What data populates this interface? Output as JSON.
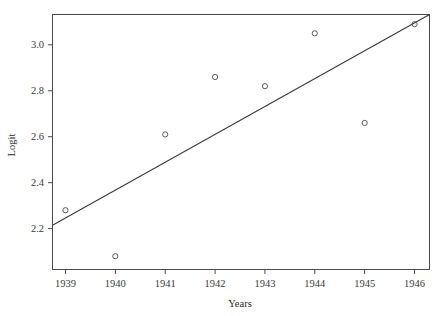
{
  "chart_data": {
    "type": "scatter",
    "title": "",
    "xlabel": "Years",
    "ylabel": "Logit",
    "x": [
      1939,
      1940,
      1941,
      1942,
      1943,
      1944,
      1945,
      1946
    ],
    "values": [
      2.28,
      2.08,
      2.61,
      2.86,
      2.82,
      3.05,
      2.66,
      3.09
    ],
    "series": [
      {
        "name": "Logit",
        "type": "scatter",
        "marker": "open-circle",
        "points": [
          {
            "x": 1939,
            "y": 2.28
          },
          {
            "x": 1940,
            "y": 2.08
          },
          {
            "x": 1941,
            "y": 2.61
          },
          {
            "x": 1942,
            "y": 2.86
          },
          {
            "x": 1943,
            "y": 2.82
          },
          {
            "x": 1944,
            "y": 3.05
          },
          {
            "x": 1945,
            "y": 2.66
          },
          {
            "x": 1946,
            "y": 3.09
          }
        ]
      },
      {
        "name": "Fitted regression line",
        "type": "line",
        "endpoints": [
          {
            "x": 1938.74,
            "y": 2.215
          },
          {
            "x": 1946.3,
            "y": 3.132
          }
        ]
      }
    ],
    "xticks": [
      1939,
      1940,
      1941,
      1942,
      1943,
      1944,
      1945,
      1946
    ],
    "xtick_labels": [
      "1939",
      "1940",
      "1941",
      "1942",
      "1943",
      "1944",
      "1945",
      "1946"
    ],
    "yticks": [
      2.2,
      2.4,
      2.6,
      2.8,
      3.0
    ],
    "ytick_labels": [
      "2.2",
      "2.4",
      "2.6",
      "2.8",
      "3.0"
    ],
    "xlim": [
      1938.74,
      1946.3
    ],
    "ylim": [
      2.022,
      3.132
    ],
    "grid": false,
    "legend": null,
    "frame": true,
    "colors": {
      "line": "#3a3a3a",
      "marker": "#4a4a4a",
      "axis": "#4a4a4a",
      "background": "#ffffff",
      "text": "#2b2b2b"
    }
  }
}
